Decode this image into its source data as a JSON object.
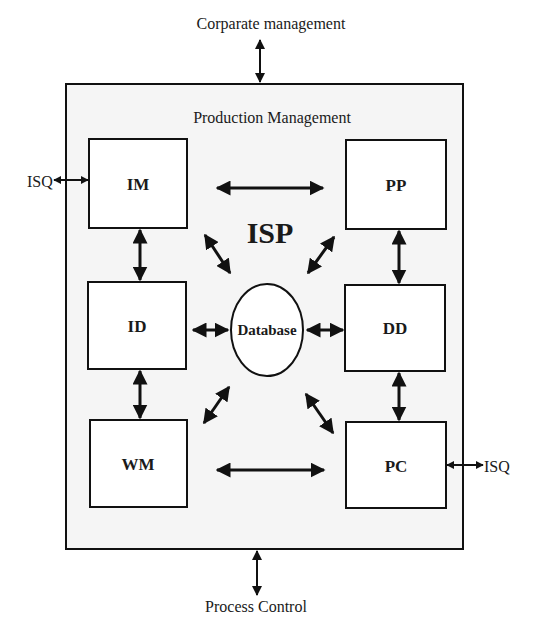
{
  "diagram": {
    "external": {
      "top": "Corparate management",
      "bottom": "Process Control",
      "left": "ISQ",
      "right": "ISQ"
    },
    "container": {
      "title": "Production Management",
      "center_label": "ISP"
    },
    "modules": [
      {
        "id": "IM",
        "label": "IM"
      },
      {
        "id": "ID",
        "label": "ID"
      },
      {
        "id": "WM",
        "label": "WM"
      },
      {
        "id": "PP",
        "label": "PP"
      },
      {
        "id": "DD",
        "label": "DD"
      },
      {
        "id": "PC",
        "label": "PC"
      }
    ],
    "database": {
      "label": "Database"
    },
    "connections": [
      {
        "from": "Corparate management",
        "to": "Production Management",
        "type": "bidirectional"
      },
      {
        "from": "Production Management",
        "to": "Process Control",
        "type": "bidirectional"
      },
      {
        "from": "ISQ",
        "to": "IM",
        "type": "bidirectional"
      },
      {
        "from": "PC",
        "to": "ISQ",
        "type": "bidirectional"
      },
      {
        "from": "IM",
        "to": "PP",
        "type": "bidirectional"
      },
      {
        "from": "WM",
        "to": "PC",
        "type": "bidirectional"
      },
      {
        "from": "IM",
        "to": "ID",
        "type": "bidirectional"
      },
      {
        "from": "ID",
        "to": "WM",
        "type": "bidirectional"
      },
      {
        "from": "PP",
        "to": "DD",
        "type": "bidirectional"
      },
      {
        "from": "DD",
        "to": "PC",
        "type": "bidirectional"
      },
      {
        "from": "ID",
        "to": "Database",
        "type": "bidirectional"
      },
      {
        "from": "DD",
        "to": "Database",
        "type": "bidirectional"
      },
      {
        "from": "IM",
        "to": "Database",
        "type": "bidirectional"
      },
      {
        "from": "PP",
        "to": "Database",
        "type": "bidirectional"
      },
      {
        "from": "WM",
        "to": "Database",
        "type": "bidirectional"
      },
      {
        "from": "PC",
        "to": "Database",
        "type": "bidirectional"
      }
    ],
    "colors": {
      "stroke": "#111111",
      "background": "#ffffff",
      "container_fill": "#f4f4f4"
    }
  }
}
